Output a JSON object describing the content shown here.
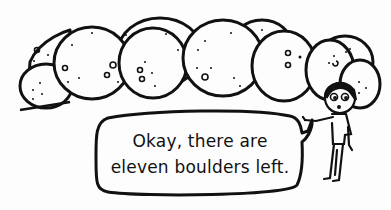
{
  "comic": {
    "speech_bubble": {
      "line1": "Okay, there are",
      "line2": "eleven boulders left."
    },
    "scene": {
      "boulder_count_depicted": 11,
      "character": "stick-figure-with-hair"
    },
    "colors": {
      "ink": "#111111",
      "paper": "#fdfdfd"
    }
  }
}
